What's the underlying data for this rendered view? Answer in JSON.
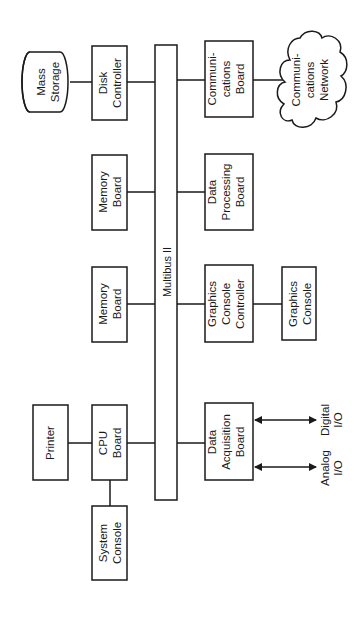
{
  "diagram": {
    "bus": {
      "label": "Multibus II"
    },
    "components": {
      "mass_storage": [
        "Mass",
        "Storage"
      ],
      "disk_controller": [
        "Disk",
        "Controller"
      ],
      "memory_board_1": [
        "Memory",
        "Board"
      ],
      "memory_board_2": [
        "Memory",
        "Board"
      ],
      "cpu_board": [
        "CPU",
        "Board"
      ],
      "printer": [
        "Printer"
      ],
      "system_console": [
        "System",
        "Console"
      ],
      "communications_board": [
        "Communi-",
        "cations",
        "Board"
      ],
      "communications_network": [
        "Communi-",
        "cations",
        "Network"
      ],
      "data_processing_board": [
        "Data",
        "Processing",
        "Board"
      ],
      "graphics_console_controller": [
        "Graphics",
        "Console",
        "Controller"
      ],
      "graphics_console": [
        "Graphics",
        "Console"
      ],
      "data_acquisition_board": [
        "Data",
        "Acquisition",
        "Board"
      ],
      "digital_io": [
        "Digital",
        "I/O"
      ],
      "analog_io": [
        "Analog",
        "I/O"
      ]
    },
    "connections": [
      [
        "mass_storage",
        "disk_controller"
      ],
      [
        "disk_controller",
        "bus"
      ],
      [
        "memory_board_1",
        "bus"
      ],
      [
        "memory_board_2",
        "bus"
      ],
      [
        "cpu_board",
        "bus"
      ],
      [
        "printer",
        "cpu_board"
      ],
      [
        "cpu_board",
        "system_console"
      ],
      [
        "communications_board",
        "bus"
      ],
      [
        "communications_board",
        "communications_network"
      ],
      [
        "data_processing_board",
        "bus"
      ],
      [
        "graphics_console_controller",
        "bus"
      ],
      [
        "graphics_console_controller",
        "graphics_console"
      ],
      [
        "data_acquisition_board",
        "bus"
      ],
      [
        "data_acquisition_board",
        "digital_io"
      ],
      [
        "data_acquisition_board",
        "analog_io"
      ]
    ]
  }
}
